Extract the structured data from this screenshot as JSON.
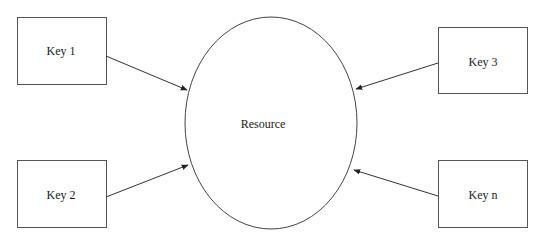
{
  "diagram": {
    "center": {
      "label": "Resource"
    },
    "keys": [
      {
        "id": "key-1",
        "label": "Key 1"
      },
      {
        "id": "key-2",
        "label": "Key 2"
      },
      {
        "id": "key-3",
        "label": "Key 3"
      },
      {
        "id": "key-n",
        "label": "Key n"
      }
    ],
    "edges": [
      {
        "from": "key-1",
        "to": "resource"
      },
      {
        "from": "key-2",
        "to": "resource"
      },
      {
        "from": "key-3",
        "to": "resource"
      },
      {
        "from": "key-n",
        "to": "resource"
      }
    ],
    "colors": {
      "stroke": "#333333",
      "background": "#ffffff",
      "text": "#1a1a1a"
    }
  }
}
